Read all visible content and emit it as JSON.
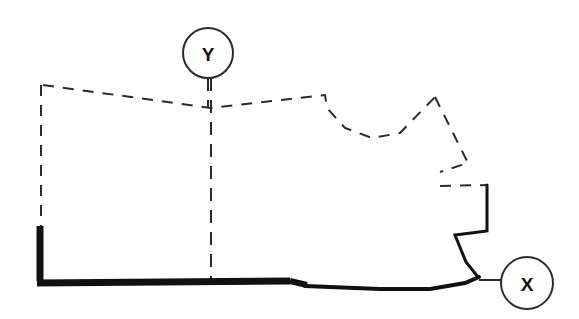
{
  "diagram": {
    "canvas": {
      "width": 579,
      "height": 319,
      "background": "#ffffff"
    },
    "colors": {
      "line": "#1a1a1a",
      "bold_line": "#111111",
      "dashed_line": "#2b2b2b",
      "circle_stroke": "#2b2b2b",
      "label_text": "#111111",
      "background": "#ffffff"
    },
    "markers": [
      {
        "id": "marker-y",
        "label": "Y",
        "cx": 208,
        "cy": 53,
        "r": 25,
        "font_size": 19,
        "leader": "vertical-down"
      },
      {
        "id": "marker-x",
        "label": "X",
        "cx": 527,
        "cy": 283,
        "r": 26,
        "font_size": 19,
        "leader": "horizontal-left"
      }
    ],
    "boundary": {
      "bold_segments_label": "Solid bold boundary (west edge and south edge)",
      "dashed_segments_label": "Dashed boundary (north edge, east edge, interior axis)",
      "bold_west_path": "M 40,226 L 40,283",
      "bold_south_path": "M 38,283 L 290,281 L 305,284 L 400,288 L 452,285 L 478,277",
      "bold_east_step_path": "M 478,277 L 466,262 L 455,235 L 487,231 L 487,185",
      "dashed_north_path": "M 43,85 L 211,108 L 325,95 L 327,108 L 345,128 L 372,138 L 400,133 L 435,97",
      "dashed_west_path": "M 41,85 L 41,226",
      "dashed_east_path": "M 435,97 L 468,163 L 440,172",
      "dashed_east_lower_path": "M 440,186 L 487,185",
      "dashed_axis_path": "M 211,78 L 211,281",
      "x_leader_path": "M 478,280 L 503,280",
      "y_leader_path": "M 208,78 L 208,108"
    },
    "style": {
      "bold_stroke_width": 6,
      "solid_stroke_width": 3,
      "dashed_stroke_width": 2,
      "dash_pattern": "11 9",
      "circle_stroke_width": 2
    }
  }
}
